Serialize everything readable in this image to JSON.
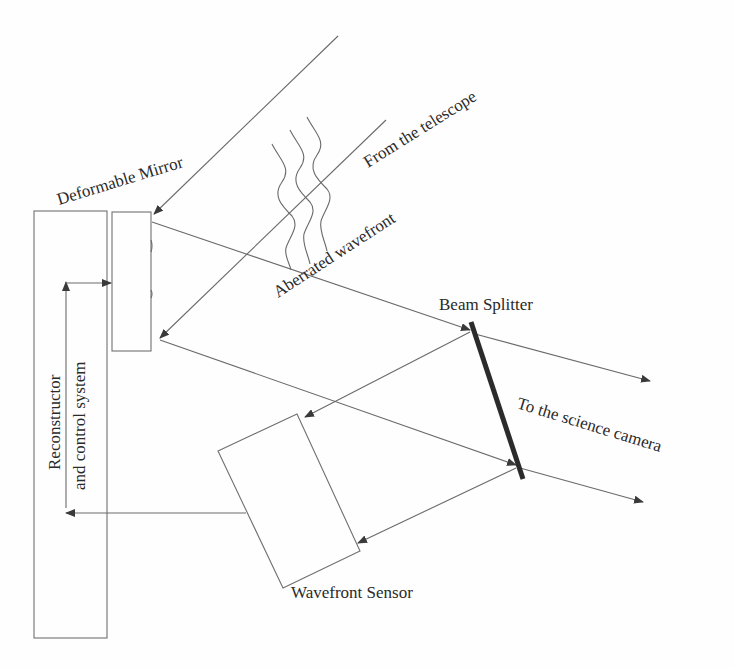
{
  "diagram": {
    "labels": {
      "deformable_mirror": "Deformable Mirror",
      "from_telescope": "From the telescope",
      "aberrated_wavefront": "Aberrated wavefront",
      "beam_splitter": "Beam Splitter",
      "to_science_camera": "To the science camera",
      "wavefront_sensor": "Wavefront Sensor",
      "reconstructor_line1": "Reconstructor",
      "reconstructor_line2": "and control system"
    },
    "components": [
      {
        "id": "reconstructor",
        "shape": "rect",
        "x": 34,
        "y": 211,
        "w": 73,
        "h": 427
      },
      {
        "id": "deformable-mirror",
        "shape": "rect",
        "x": 112,
        "y": 212,
        "w": 39,
        "h": 139
      },
      {
        "id": "beam-splitter",
        "shape": "thick-line",
        "from": [
          471,
          322
        ],
        "to": [
          523,
          479
        ]
      },
      {
        "id": "wavefront-sensor",
        "shape": "rotated-rect",
        "points": [
          [
            218,
            451
          ],
          [
            297,
            414
          ],
          [
            360,
            551
          ],
          [
            283,
            588
          ]
        ]
      }
    ],
    "colors": {
      "line": "#6a6a6a",
      "text": "#2a2a2a",
      "beam_splitter": "#2b2b2b",
      "background": "#fefefe"
    }
  }
}
